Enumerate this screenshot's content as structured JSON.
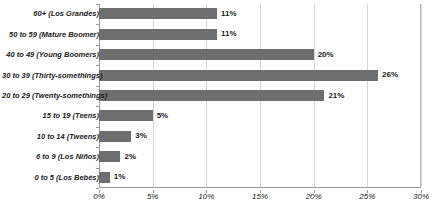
{
  "chart_data": {
    "type": "bar",
    "orientation": "horizontal",
    "title": "",
    "xlabel": "",
    "ylabel": "",
    "xlim": [
      0,
      30
    ],
    "xticks": [
      "0%",
      "5%",
      "10%",
      "15%",
      "20%",
      "25%",
      "30%"
    ],
    "xtick_values": [
      0,
      5,
      10,
      15,
      20,
      25,
      30
    ],
    "grid": true,
    "legend": false,
    "bar_color": "#6e6e6e",
    "gridline_color": "#d6d6d6",
    "axis_color": "#9a9a9a",
    "categories": [
      "60+ (Los Grandes)",
      "50 to 59 (Mature Boomer)",
      "40 to 49 (Young Boomers)",
      "30 to 39 (Thirty-somethings)",
      "20 to 29 (Twenty-somethings)",
      "15 to 19 (Teens)",
      "10 to 14 (Tweens)",
      "6 to 9 (Los Niños)",
      "0 to 5 (Los Bebés)"
    ],
    "values": [
      11,
      11,
      20,
      26,
      21,
      5,
      3,
      2,
      1
    ],
    "value_labels": [
      "11%",
      "11%",
      "20%",
      "26%",
      "21%",
      "5%",
      "3%",
      "2%",
      "1%"
    ]
  }
}
